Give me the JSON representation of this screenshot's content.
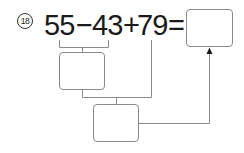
{
  "problem": {
    "number_label": "⑱",
    "number": "18",
    "tokens": [
      "55",
      "−",
      "43",
      "+",
      "79",
      "="
    ],
    "operand1": "55",
    "op1": "−",
    "operand2": "43",
    "op2": "+",
    "operand3": "79",
    "equals": "="
  },
  "boxes": {
    "step1_answer": "",
    "step2_answer": "",
    "final_answer": ""
  },
  "colors": {
    "text": "#1a1a1a",
    "lines": "#8a8a8a"
  }
}
